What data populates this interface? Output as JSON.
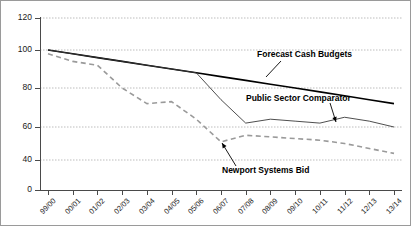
{
  "chart_data": {
    "type": "line",
    "title": "",
    "xlabel": "",
    "ylabel": "",
    "ylim": [
      0,
      120
    ],
    "yticks": [
      0,
      40,
      60,
      80,
      100,
      120
    ],
    "ytick_labels": [
      "0",
      "40",
      "60",
      "80",
      "100",
      "120"
    ],
    "grid": true,
    "legend": "none (inline annotations)",
    "categories": [
      "99/00",
      "00/01",
      "01/02",
      "02/03",
      "03/04",
      "04/05",
      "05/06",
      "06/07",
      "07/08",
      "08/09",
      "09/10",
      "10/11",
      "11/12",
      "12/13",
      "13/14"
    ],
    "series": [
      {
        "name": "Forecast Cash Budgets",
        "style": "solid-thick",
        "color": "#000000",
        "values": [
          100,
          98,
          96,
          94,
          92,
          90,
          88,
          86,
          84,
          82,
          80,
          78,
          76,
          74,
          72
        ]
      },
      {
        "name": "Public Sector Comparator",
        "style": "solid-thin",
        "color": "#3a3a3a",
        "values": [
          100,
          98,
          96,
          94,
          92,
          90,
          88,
          74,
          62,
          64,
          63,
          62,
          65,
          63,
          60
        ]
      },
      {
        "name": "Newport Systems Bid",
        "style": "dashed",
        "color": "#9a9a9a",
        "values": [
          98,
          94,
          92,
          80,
          72,
          73,
          64,
          51,
          55,
          54,
          53,
          52,
          50,
          47,
          44
        ]
      }
    ],
    "annotations": [
      {
        "text": "Forecast Cash Budgets",
        "pointer": "leader-line-down-left"
      },
      {
        "text": "Public Sector Comparator",
        "pointer": "arrow-down"
      },
      {
        "text": "Newport Systems Bid",
        "pointer": "arrow-up-left"
      }
    ]
  }
}
